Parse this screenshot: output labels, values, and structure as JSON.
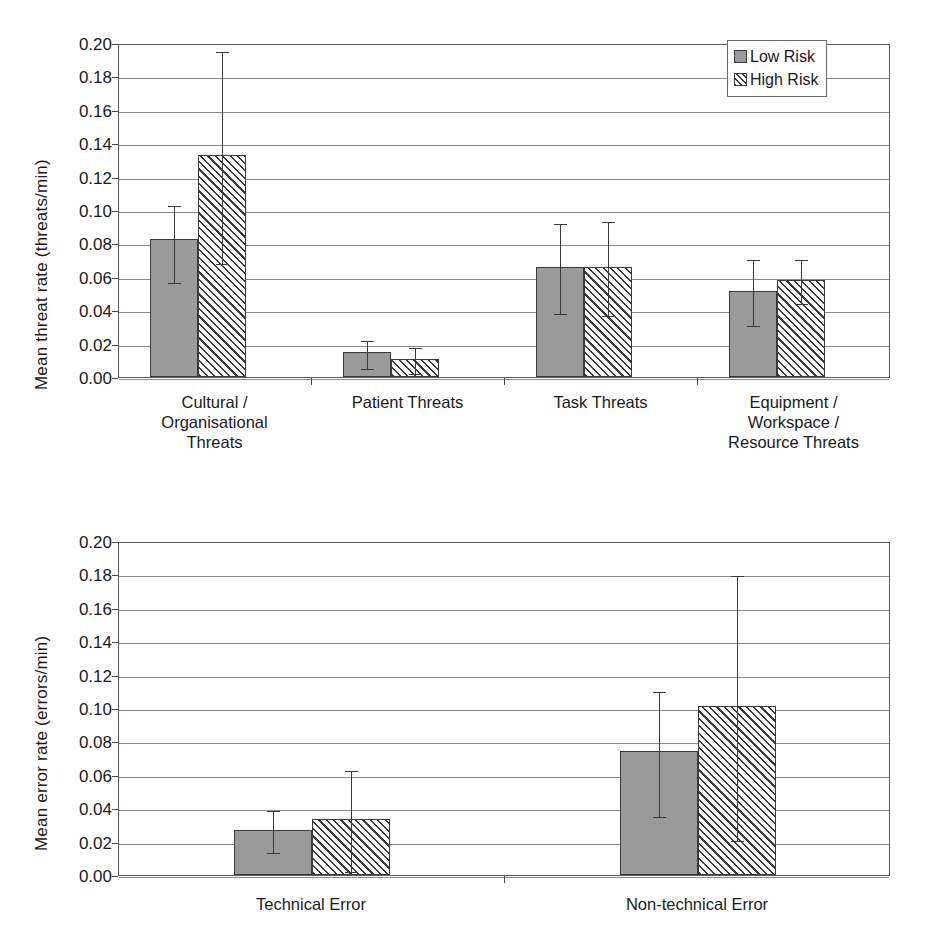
{
  "chart_data": [
    {
      "id": "threats",
      "type": "bar",
      "title": "",
      "xlabel": "",
      "ylabel": "Mean threat rate (threats/min)",
      "ylim": [
        0,
        0.2
      ],
      "ytick_step": 0.02,
      "yticks": [
        "0.00",
        "0.02",
        "0.04",
        "0.06",
        "0.08",
        "0.10",
        "0.12",
        "0.14",
        "0.16",
        "0.18",
        "0.20"
      ],
      "grid": true,
      "legend_position": "top-right",
      "categories": [
        "Cultural /\nOrganisational\nThreats",
        "Patient Threats",
        "Task Threats",
        "Equipment /\nWorkspace /\nResource Threats"
      ],
      "category_lines": [
        [
          "Cultural /",
          "Organisational",
          "Threats"
        ],
        [
          "Patient Threats"
        ],
        [
          "Task Threats"
        ],
        [
          "Equipment /",
          "Workspace /",
          "Resource Threats"
        ]
      ],
      "series": [
        {
          "name": "Low Risk",
          "fill": "solid-gray",
          "values": [
            0.0825,
            0.015,
            0.066,
            0.0518
          ],
          "err_low": [
            0.0573,
            0.0058,
            0.039,
            0.0315
          ],
          "err_high": [
            0.1035,
            0.0228,
            0.093,
            0.0713
          ]
        },
        {
          "name": "High Risk",
          "fill": "diagonal-hatch",
          "values": [
            0.1328,
            0.011,
            0.066,
            0.0578
          ],
          "err_low": [
            0.069,
            0.003,
            0.038,
            0.045
          ],
          "err_high": [
            0.196,
            0.0188,
            0.094,
            0.0713
          ]
        }
      ]
    },
    {
      "id": "errors",
      "type": "bar",
      "title": "",
      "xlabel": "",
      "ylabel": "Mean error rate (errors/min)",
      "ylim": [
        0,
        0.2
      ],
      "ytick_step": 0.02,
      "yticks": [
        "0.00",
        "0.02",
        "0.04",
        "0.06",
        "0.08",
        "0.10",
        "0.12",
        "0.14",
        "0.16",
        "0.18",
        "0.20"
      ],
      "grid": true,
      "legend_position": "none",
      "categories": [
        "Technical Error",
        "Non-technical Error"
      ],
      "category_lines": [
        [
          "Technical Error"
        ],
        [
          "Non-technical Error"
        ]
      ],
      "series": [
        {
          "name": "Low Risk",
          "fill": "solid-gray",
          "values": [
            0.0268,
            0.074
          ],
          "err_low": [
            0.0143,
            0.036
          ],
          "err_high": [
            0.0395,
            0.1105
          ]
        },
        {
          "name": "High Risk",
          "fill": "diagonal-hatch",
          "values": [
            0.0338,
            0.101
          ],
          "err_low": [
            0.003,
            0.0218
          ],
          "err_high": [
            0.0633,
            0.18
          ]
        }
      ]
    }
  ],
  "legend": {
    "items": [
      {
        "label": "Low Risk",
        "swatch": "solid-gray"
      },
      {
        "label": "High Risk",
        "swatch": "diagonal-hatch"
      }
    ]
  },
  "colors": {
    "low_risk_fill": "#9a9a9a",
    "hatch_stroke": "#3a3a3a",
    "gridline": "#8a8a8a",
    "axis": "#5a5a5a",
    "text": "#1a1a1a",
    "background": "#ffffff"
  }
}
